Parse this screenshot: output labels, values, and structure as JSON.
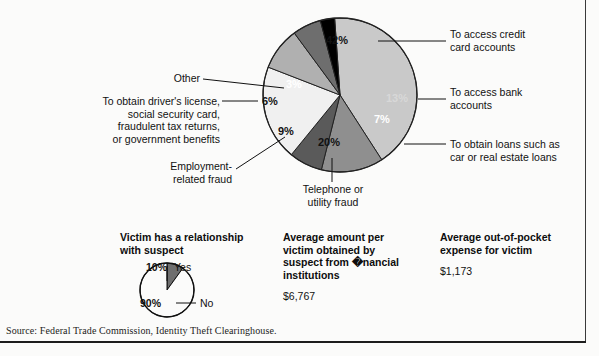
{
  "chart_data": {
    "type": "pie",
    "title": "",
    "categories": [
      "To access credit card accounts",
      "To access bank accounts",
      "To obtain loans such as car or real estate loans",
      "Telephone or utility fraud",
      "Employment-related fraud",
      "To obtain driver's license, social security card, fraudulent tax returns, or government benefits",
      "Other"
    ],
    "values": [
      42,
      13,
      7,
      20,
      9,
      6,
      3
    ],
    "value_labels": [
      "42%",
      "13%",
      "7%",
      "20%",
      "9%",
      "6%",
      "3%"
    ],
    "colors": [
      "#c9c9c9",
      "#8f8f8f",
      "#5a5a5a",
      "#f0f0f0",
      "#b0b0b0",
      "#6e6e6e",
      "#000000"
    ],
    "legend_position": "callout-labels",
    "grid": false,
    "start_angle_deg": -4,
    "direction": "clockwise"
  },
  "pie": {
    "slices": [
      {
        "key": "credit",
        "label": "To access credit\ncard accounts",
        "pct": "42%",
        "value": 42,
        "color": "#c9c9c9",
        "pct_class": "onwhite"
      },
      {
        "key": "bank",
        "label": "To access bank\naccounts",
        "pct": "13%",
        "value": 13,
        "color": "#8f8f8f",
        "pct_class": "ongray"
      },
      {
        "key": "loans",
        "label": "To obtain loans such as\ncar or real estate loans",
        "pct": "7%",
        "value": 7,
        "color": "#5a5a5a",
        "pct_class": "ondark"
      },
      {
        "key": "telephone",
        "label": "Telephone or\nutility fraud",
        "pct": "20%",
        "value": 20,
        "color": "#f0f0f0",
        "pct_class": "onwhite"
      },
      {
        "key": "employment",
        "label": "Employment-\nrelated fraud",
        "pct": "9%",
        "value": 9,
        "color": "#b0b0b0",
        "pct_class": "onwhite"
      },
      {
        "key": "license",
        "label": "To obtain driver's license,\nsocial security card,\nfraudulent tax returns,\nor government benefits",
        "pct": "6%",
        "value": 6,
        "color": "#6e6e6e",
        "pct_class": "onwhite"
      },
      {
        "key": "other",
        "label": "Other",
        "pct": "3%",
        "value": 3,
        "color": "#000000",
        "pct_class": "ondark"
      }
    ]
  },
  "stats": {
    "relationship": {
      "title": "Victim has a relationship\nwith suspect",
      "yes_pct": "10%",
      "yes_label": "Yes",
      "no_pct": "90%",
      "no_label": "No",
      "yes_value": 10,
      "no_value": 90,
      "yes_color": "#6e6e6e",
      "no_color": "#fbfbfa"
    },
    "amount": {
      "title": "Average amount per\nvictim obtained by\nsuspect from �nancial\ninstitutions",
      "value": "$6,767"
    },
    "expense": {
      "title": "Average out-of-pocket\nexpense for victim",
      "value": "$1,173"
    }
  },
  "source": "Source: Federal Trade Commission, Identity Theft Clearinghouse."
}
